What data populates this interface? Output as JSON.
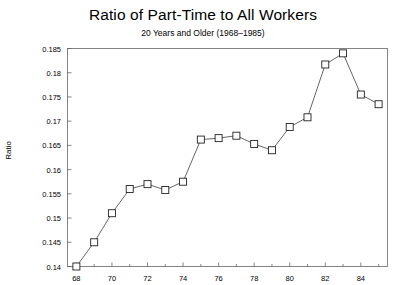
{
  "chart_data": {
    "type": "line",
    "title": "Ratio of Part-Time to All Workers",
    "subtitle": "20 Years and Older (1968–1985)",
    "xlabel": "",
    "ylabel": "Ratio",
    "grid": false,
    "legend": "none",
    "marker": "open-square",
    "xlim": [
      67.5,
      85.5
    ],
    "ylim": [
      0.14,
      0.185
    ],
    "x": [
      68,
      69,
      70,
      71,
      72,
      73,
      74,
      75,
      76,
      77,
      78,
      79,
      80,
      81,
      82,
      83,
      84,
      85
    ],
    "values": [
      0.14,
      0.145,
      0.151,
      0.156,
      0.157,
      0.1558,
      0.1575,
      0.1662,
      0.1665,
      0.167,
      0.1653,
      0.164,
      0.1688,
      0.1708,
      0.1817,
      0.184,
      0.1755,
      0.1735
    ],
    "xticks": [
      68,
      70,
      72,
      74,
      76,
      78,
      80,
      82,
      84
    ],
    "xtick_labels": [
      "68",
      "70",
      "72",
      "74",
      "76",
      "78",
      "80",
      "82",
      "84"
    ],
    "xminor_ticks": [
      69,
      71,
      73,
      75,
      77,
      79,
      81,
      83,
      85
    ],
    "yticks": [
      0.14,
      0.145,
      0.15,
      0.155,
      0.16,
      0.165,
      0.17,
      0.175,
      0.18,
      0.185
    ],
    "ytick_labels": [
      "0.14",
      "0.145",
      "0.15",
      "0.155",
      "0.16",
      "0.165",
      "0.17",
      "0.175",
      "0.18",
      "0.185"
    ],
    "line_color": "#555555",
    "marker_color": "#222222",
    "axis_color": "#666666"
  }
}
